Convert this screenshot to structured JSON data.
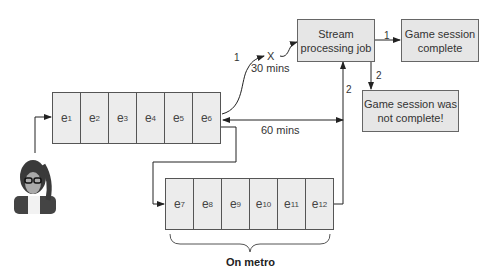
{
  "row1": {
    "cells": [
      {
        "base": "e",
        "sub": "1"
      },
      {
        "base": "e",
        "sub": "2"
      },
      {
        "base": "e",
        "sub": "3"
      },
      {
        "base": "e",
        "sub": "4"
      },
      {
        "base": "e",
        "sub": "5"
      },
      {
        "base": "e",
        "sub": "6"
      }
    ]
  },
  "row2": {
    "cells": [
      {
        "base": "e",
        "sub": "7"
      },
      {
        "base": "e",
        "sub": "8"
      },
      {
        "base": "e",
        "sub": "9"
      },
      {
        "base": "e",
        "sub": "10"
      },
      {
        "base": "e",
        "sub": "11"
      },
      {
        "base": "e",
        "sub": "12"
      }
    ]
  },
  "boxes": {
    "stream": "Stream processing job",
    "complete": "Game session complete",
    "not_complete": "Game session was not complete!"
  },
  "labels": {
    "path1": "1",
    "x_mark": "X",
    "thirty": "30 mins",
    "sixty": "60 mins",
    "path2_up": "2",
    "out1": "1",
    "out2": "2",
    "metro": "On metro"
  },
  "icons": {
    "user": "user-avatar-icon"
  }
}
